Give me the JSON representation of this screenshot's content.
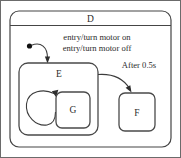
{
  "diagram": {
    "type": "uml-state-machine",
    "outer_state": {
      "name": "D",
      "entry_actions": [
        "entry/turn motor on",
        "entry/turn motor off"
      ]
    },
    "states": [
      {
        "id": "E",
        "label": "E"
      },
      {
        "id": "G",
        "label": "G"
      },
      {
        "id": "F",
        "label": "F"
      }
    ],
    "transitions": [
      {
        "id": "initial-to-e",
        "label": ""
      },
      {
        "id": "g-self-loop",
        "label": ""
      },
      {
        "id": "e-to-f",
        "label": "After 0.5s"
      }
    ],
    "initial_pseudostate": "initial-state-dot",
    "colors": {
      "line": "#454545",
      "text": "#2b2b2b",
      "background": "#ffffff",
      "frame": "#6b6b6b"
    }
  }
}
